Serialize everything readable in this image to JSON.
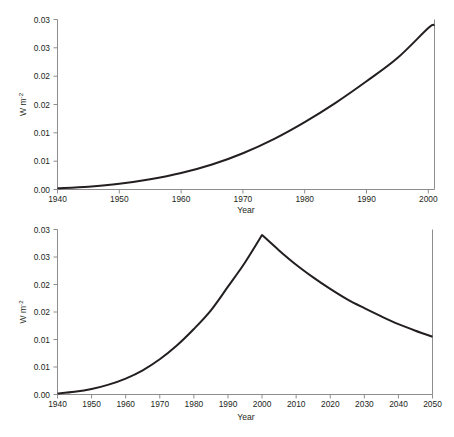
{
  "figure": {
    "background": "#ffffff",
    "line_color": "#231f20",
    "axis_color": "#8d8d8d"
  },
  "panels": [
    {
      "id": "top",
      "ylabel": "W m",
      "ylabel_sup": "-2",
      "xlabel": "Year",
      "ytick_labels": [
        "0.03",
        "0.03",
        "0.02",
        "0.02",
        "0.01",
        "0.01",
        "0.00"
      ],
      "xtick_labels": [
        "1940",
        "1950",
        "1960",
        "1970",
        "1980",
        "1990",
        "2000"
      ]
    },
    {
      "id": "bottom",
      "ylabel": "W m",
      "ylabel_sup": "-2",
      "xlabel": "Year",
      "ytick_labels": [
        "0.03",
        "0.03",
        "0.02",
        "0.02",
        "0.01",
        "0.01",
        "0.00"
      ],
      "xtick_labels": [
        "1940",
        "1950",
        "1960",
        "1970",
        "1980",
        "1990",
        "2000",
        "2010",
        "2020",
        "2030",
        "2040",
        "2050"
      ]
    }
  ],
  "chart_data": [
    {
      "type": "line",
      "panel": "top",
      "title": "",
      "xlabel": "Year",
      "ylabel": "W m-2",
      "xlim": [
        1940,
        2001
      ],
      "ylim": [
        0.0,
        0.03
      ],
      "xticks": [
        1940,
        1950,
        1960,
        1970,
        1980,
        1990,
        2000
      ],
      "xtick_labels": [
        "1940",
        "1950",
        "1960",
        "1970",
        "1980",
        "1990",
        "2000"
      ],
      "yticks": [
        0.0,
        0.005,
        0.01,
        0.015,
        0.02,
        0.025,
        0.03
      ],
      "ytick_labels": [
        "0.00",
        "0.01",
        "0.01",
        "0.02",
        "0.02",
        "0.03",
        "0.03"
      ],
      "grid": false,
      "legend": false,
      "series": [
        {
          "name": "historical radiative forcing",
          "x": [
            1940,
            1945,
            1950,
            1955,
            1960,
            1965,
            1970,
            1975,
            1980,
            1985,
            1990,
            1995,
            2000,
            2001
          ],
          "values": [
            0.0002,
            0.0005,
            0.001,
            0.0018,
            0.0029,
            0.0044,
            0.0064,
            0.0089,
            0.0119,
            0.0153,
            0.0191,
            0.0232,
            0.0285,
            0.029
          ]
        }
      ]
    },
    {
      "type": "line",
      "panel": "bottom",
      "title": "",
      "xlabel": "Year",
      "ylabel": "W m-2",
      "xlim": [
        1940,
        2050
      ],
      "ylim": [
        0.0,
        0.03
      ],
      "xticks": [
        1940,
        1950,
        1960,
        1970,
        1980,
        1990,
        2000,
        2010,
        2020,
        2030,
        2040,
        2050
      ],
      "xtick_labels": [
        "1940",
        "1950",
        "1960",
        "1970",
        "1980",
        "1990",
        "2000",
        "2010",
        "2020",
        "2030",
        "2040",
        "2050"
      ],
      "yticks": [
        0.0,
        0.005,
        0.01,
        0.015,
        0.02,
        0.025,
        0.03
      ],
      "ytick_labels": [
        "0.00",
        "0.01",
        "0.01",
        "0.02",
        "0.02",
        "0.03",
        "0.03"
      ],
      "grid": false,
      "legend": false,
      "peak": {
        "x": 2000,
        "y": 0.029
      },
      "series": [
        {
          "name": "radiative forcing with projected decline",
          "x": [
            1940,
            1945,
            1950,
            1955,
            1960,
            1965,
            1970,
            1975,
            1980,
            1985,
            1990,
            1995,
            2000,
            2005,
            2010,
            2015,
            2020,
            2025,
            2030,
            2035,
            2040,
            2045,
            2050
          ],
          "values": [
            0.0002,
            0.0005,
            0.001,
            0.0018,
            0.0029,
            0.0044,
            0.0064,
            0.0089,
            0.0119,
            0.0153,
            0.0196,
            0.024,
            0.029,
            0.0262,
            0.0236,
            0.0213,
            0.0192,
            0.0173,
            0.0157,
            0.0142,
            0.0128,
            0.0116,
            0.0105
          ]
        }
      ]
    }
  ]
}
